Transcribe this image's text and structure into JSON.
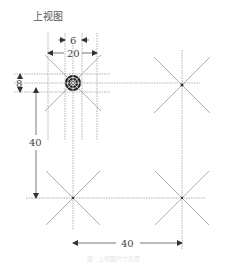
{
  "title": "上视图",
  "dimensions": {
    "top_inner": "6",
    "top_outer": "20",
    "left_small": "8",
    "left_vertical": "40",
    "bottom_horizontal": "40"
  },
  "nodes": [
    {
      "name": "top-left",
      "type": "hub-connector"
    },
    {
      "name": "top-right",
      "type": "star-junction"
    },
    {
      "name": "bottom-left",
      "type": "star-junction"
    },
    {
      "name": "bottom-right",
      "type": "star-junction"
    }
  ],
  "colors": {
    "line": "#9a9a9a",
    "dim": "#555555",
    "hub": "#222222"
  },
  "caption": "图 · 上视图尺寸示意"
}
